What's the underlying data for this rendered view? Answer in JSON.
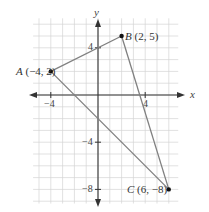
{
  "diagram": {
    "type": "coordinate-plane-triangle",
    "axes": {
      "x_label": "x",
      "y_label": "y",
      "x_ticks": [
        {
          "value": -4,
          "label": "−4"
        },
        {
          "value": 4,
          "label": "4"
        }
      ],
      "y_ticks": [
        {
          "value": 4,
          "label": "4"
        },
        {
          "value": -4,
          "label": "−4"
        },
        {
          "value": -8,
          "label": "−8"
        }
      ],
      "grid_x_range": [
        -5,
        6
      ],
      "grid_y_range": [
        -9,
        6
      ]
    },
    "points": [
      {
        "name": "A",
        "x": -4,
        "y": 2,
        "label": "A (−4, 2)"
      },
      {
        "name": "B",
        "x": 2,
        "y": 5,
        "label": "B (2, 5)"
      },
      {
        "name": "C",
        "x": 6,
        "y": -8,
        "label": "C (6, −8)"
      }
    ],
    "segments": [
      [
        "A",
        "B"
      ],
      [
        "B",
        "C"
      ],
      [
        "C",
        "A"
      ]
    ],
    "colors": {
      "grid": "#d4d4d4",
      "axis": "#333333",
      "segment": "#808080",
      "point": "#111111"
    }
  }
}
